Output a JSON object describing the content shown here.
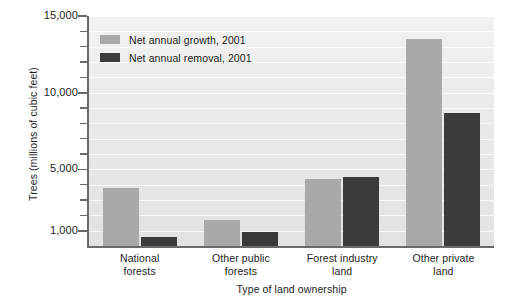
{
  "chart_data": {
    "type": "bar",
    "title": "",
    "xlabel": "Type of land ownership",
    "ylabel": "Trees (millions of cubic feet)",
    "categories": [
      "National forests",
      "Other public forests",
      "Forest industry land",
      "Other private land"
    ],
    "category_lines": [
      [
        "National",
        "forests"
      ],
      [
        "Other public",
        "forests"
      ],
      [
        "Forest industry",
        "land"
      ],
      [
        "Other private",
        "land"
      ]
    ],
    "series": [
      {
        "name": "Net annual growth, 2001",
        "color": "#a9a9a9",
        "values": [
          3800,
          1700,
          4400,
          13500
        ]
      },
      {
        "name": "Net annual removal, 2001",
        "color": "#3b3b3b",
        "values": [
          600,
          900,
          4500,
          8700
        ]
      }
    ],
    "ylim": [
      0,
      15000
    ],
    "ytick_values": [
      1000,
      2000,
      3000,
      4000,
      5000,
      6000,
      7000,
      8000,
      9000,
      10000,
      11000,
      12000,
      13000,
      14000,
      15000
    ],
    "ytick_major_values": [
      1000,
      5000,
      10000,
      15000
    ],
    "ytick_major_labels": [
      "1,000",
      "5,000",
      "10,000",
      "15,000"
    ],
    "grid": true,
    "legend_position": "top-left",
    "plot_background": "#ececec",
    "axis_color": "#6a6a6a"
  },
  "legend": {
    "items": [
      {
        "label": "Net annual growth, 2001",
        "swatch": "growth"
      },
      {
        "label": "Net annual removal, 2001",
        "swatch": "removal"
      }
    ]
  }
}
